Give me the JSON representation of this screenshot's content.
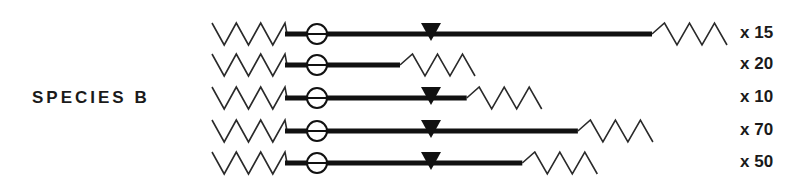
{
  "species_label": "SPECIES B",
  "colors": {
    "ink": "#111111",
    "background": "#ffffff"
  },
  "legend_symbols": {
    "left_end": "zigzag-segment",
    "origin_marker": "circle-with-bar",
    "site_marker": "filled-down-triangle",
    "right_end": "zigzag-segment"
  },
  "molecules": [
    {
      "count_label": "x 15",
      "length_relative": 1.0,
      "has_triangle": true
    },
    {
      "count_label": "x 20",
      "length_relative": 0.32,
      "has_triangle": false
    },
    {
      "count_label": "x 10",
      "length_relative": 0.5,
      "has_triangle": true
    },
    {
      "count_label": "x 70",
      "length_relative": 0.8,
      "has_triangle": true
    },
    {
      "count_label": "x 50",
      "length_relative": 0.65,
      "has_triangle": true
    }
  ]
}
